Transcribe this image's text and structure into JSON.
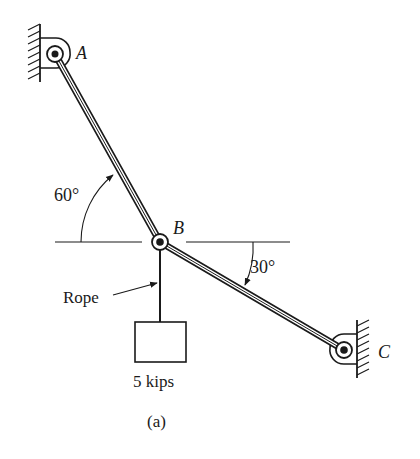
{
  "labels": {
    "point_a": "A",
    "point_b": "B",
    "point_c": "C",
    "angle_ab": "60°",
    "angle_bc": "30°",
    "rope": "Rope",
    "load": "5 kips",
    "caption": "(a)"
  },
  "colors": {
    "ink": "#1a1a1a",
    "background": "#ffffff"
  }
}
